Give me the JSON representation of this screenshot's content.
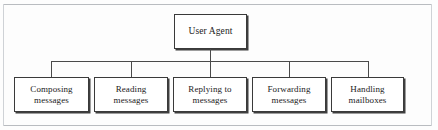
{
  "figure": {
    "type": "hierarchy-tree-diagram",
    "root": {
      "label": "User Agent",
      "line1": "User Agent",
      "line2": ""
    },
    "leaves": [
      {
        "label": "Composing messages",
        "line1": "Composing",
        "line2": "messages"
      },
      {
        "label": "Reading messages",
        "line1": "Reading",
        "line2": "messages"
      },
      {
        "label": "Replying to messages",
        "line1": "Replying to",
        "line2": "messages"
      },
      {
        "label": "Forwarding messages",
        "line1": "Forwarding",
        "line2": "messages"
      },
      {
        "label": "Handling mailboxes",
        "line1": "Handling",
        "line2": "mailboxes"
      }
    ],
    "colors": {
      "background": "#fdfdfd",
      "box_fill": "#ffffff",
      "box_border": "#3a3a3a",
      "box_shadow": "#3f3f3f",
      "connector": "#4a4a4a",
      "frame_rule": "#b9bcc0",
      "text": "#1b1b1b"
    }
  }
}
